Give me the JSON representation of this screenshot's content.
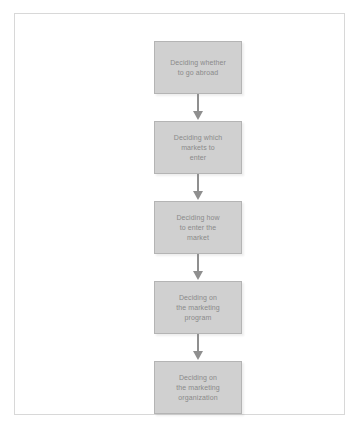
{
  "diagram": {
    "background_color": "#ffffff",
    "frame_color": "#d8d8d8",
    "box_fill_color": "#d0d0d0",
    "box_border_color": "#b4b4b4",
    "text_color": "#8a8a8a",
    "arrow_color": "#8f8f8f",
    "steps": [
      {
        "label": "Deciding whether\nto go abroad"
      },
      {
        "label": "Deciding which\nmarkets to\nenter"
      },
      {
        "label": "Deciding how\nto enter the\nmarket"
      },
      {
        "label": "Deciding on\nthe marketing\nprogram"
      },
      {
        "label": "Deciding on\nthe marketing\norganization"
      }
    ]
  }
}
